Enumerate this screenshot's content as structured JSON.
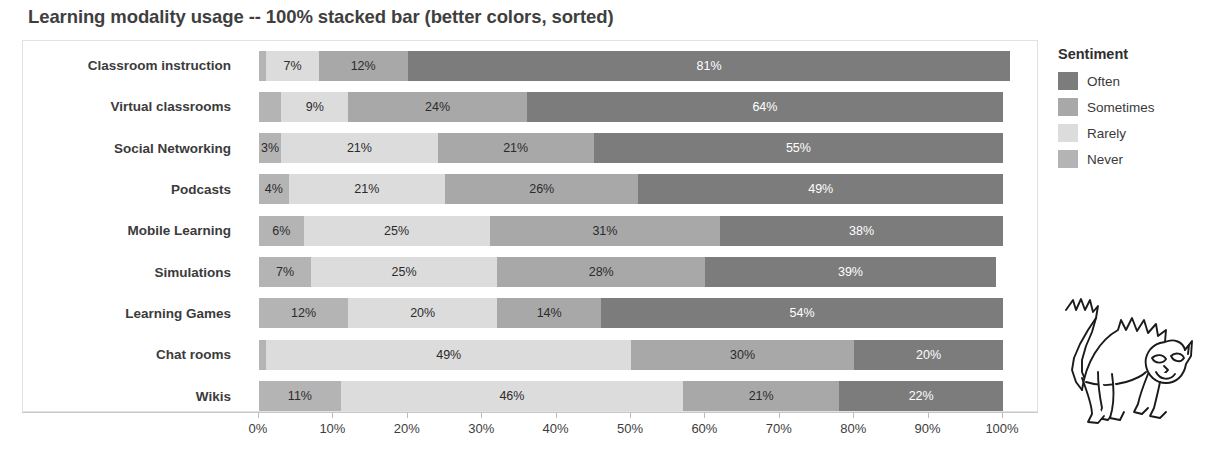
{
  "chart_data": {
    "type": "bar",
    "subtype": "100-percent-stacked-horizontal",
    "title": "Learning modality usage -- 100% stacked bar (better colors, sorted)",
    "xlabel": "",
    "ylabel": "",
    "xlim": [
      0,
      100
    ],
    "grid": false,
    "legend_position": "right",
    "legend_title": "Sentiment",
    "categories": [
      "Classroom instruction",
      "Virtual classrooms",
      "Social Networking",
      "Podcasts",
      "Mobile Learning",
      "Simulations",
      "Learning Games",
      "Chat rooms",
      "Wikis"
    ],
    "xticks": [
      "0%",
      "10%",
      "20%",
      "30%",
      "40%",
      "50%",
      "60%",
      "70%",
      "80%",
      "90%",
      "100%"
    ],
    "xtick_values": [
      0,
      10,
      20,
      30,
      40,
      50,
      60,
      70,
      80,
      90,
      100
    ],
    "series": [
      {
        "name": "Never",
        "color": "#aaaaaa",
        "values": [
          0,
          3,
          0,
          0,
          0,
          0,
          0,
          1,
          0
        ]
      },
      {
        "name": "Rarely",
        "color": "#dcdcdc",
        "values": [
          7,
          9,
          3,
          4,
          6,
          7,
          12,
          49,
          11
        ]
      },
      {
        "name": "Sometimes",
        "color": "#a8a8a8",
        "values": [
          12,
          24,
          21,
          21,
          25,
          25,
          20,
          30,
          46
        ]
      },
      {
        "name": "Often",
        "color": "#7c7c7c",
        "values": [
          81,
          64,
          55,
          49,
          31,
          28,
          14,
          20,
          21
        ]
      }
    ],
    "rows": [
      {
        "category": "Classroom instruction",
        "segments": [
          {
            "sentiment": "Never",
            "value": 1,
            "label": "",
            "label_color": "none"
          },
          {
            "sentiment": "Rarely",
            "value": 7,
            "label": "7%",
            "label_color": "dark"
          },
          {
            "sentiment": "Sometimes",
            "value": 12,
            "label": "12%",
            "label_color": "dark"
          },
          {
            "sentiment": "Often",
            "value": 81,
            "label": "81%",
            "label_color": "light"
          }
        ]
      },
      {
        "category": "Virtual classrooms",
        "segments": [
          {
            "sentiment": "Never",
            "value": 3,
            "label": "",
            "label_color": "none"
          },
          {
            "sentiment": "Rarely",
            "value": 9,
            "label": "9%",
            "label_color": "dark"
          },
          {
            "sentiment": "Sometimes",
            "value": 24,
            "label": "24%",
            "label_color": "dark"
          },
          {
            "sentiment": "Often",
            "value": 64,
            "label": "64%",
            "label_color": "light"
          }
        ]
      },
      {
        "category": "Social Networking",
        "segments": [
          {
            "sentiment": "Never",
            "value": 3,
            "label": "3%",
            "label_color": "dark"
          },
          {
            "sentiment": "Rarely",
            "value": 21,
            "label": "21%",
            "label_color": "dark"
          },
          {
            "sentiment": "Sometimes",
            "value": 21,
            "label": "21%",
            "label_color": "dark"
          },
          {
            "sentiment": "Often",
            "value": 55,
            "label": "55%",
            "label_color": "light"
          }
        ]
      },
      {
        "category": "Podcasts",
        "segments": [
          {
            "sentiment": "Never",
            "value": 4,
            "label": "4%",
            "label_color": "dark"
          },
          {
            "sentiment": "Rarely",
            "value": 21,
            "label": "21%",
            "label_color": "dark"
          },
          {
            "sentiment": "Sometimes",
            "value": 26,
            "label": "26%",
            "label_color": "dark"
          },
          {
            "sentiment": "Often",
            "value": 49,
            "label": "49%",
            "label_color": "light"
          }
        ]
      },
      {
        "category": "Mobile Learning",
        "segments": [
          {
            "sentiment": "Never",
            "value": 6,
            "label": "6%",
            "label_color": "dark"
          },
          {
            "sentiment": "Rarely",
            "value": 25,
            "label": "25%",
            "label_color": "dark"
          },
          {
            "sentiment": "Sometimes",
            "value": 31,
            "label": "31%",
            "label_color": "dark"
          },
          {
            "sentiment": "Often",
            "value": 38,
            "label": "38%",
            "label_color": "light"
          }
        ]
      },
      {
        "category": "Simulations",
        "segments": [
          {
            "sentiment": "Never",
            "value": 7,
            "label": "7%",
            "label_color": "dark"
          },
          {
            "sentiment": "Rarely",
            "value": 25,
            "label": "25%",
            "label_color": "dark"
          },
          {
            "sentiment": "Sometimes",
            "value": 28,
            "label": "28%",
            "label_color": "dark"
          },
          {
            "sentiment": "Often",
            "value": 39,
            "label": "39%",
            "label_color": "light"
          }
        ]
      },
      {
        "category": "Learning Games",
        "segments": [
          {
            "sentiment": "Never",
            "value": 12,
            "label": "12%",
            "label_color": "dark"
          },
          {
            "sentiment": "Rarely",
            "value": 20,
            "label": "20%",
            "label_color": "dark"
          },
          {
            "sentiment": "Sometimes",
            "value": 14,
            "label": "14%",
            "label_color": "dark"
          },
          {
            "sentiment": "Often",
            "value": 54,
            "label": "54%",
            "label_color": "light"
          }
        ]
      },
      {
        "category": "Chat rooms",
        "segments": [
          {
            "sentiment": "Never",
            "value": 1,
            "label": "",
            "label_color": "none"
          },
          {
            "sentiment": "Rarely",
            "value": 49,
            "label": "49%",
            "label_color": "dark"
          },
          {
            "sentiment": "Sometimes",
            "value": 30,
            "label": "30%",
            "label_color": "dark"
          },
          {
            "sentiment": "Often",
            "value": 20,
            "label": "20%",
            "label_color": "light"
          }
        ]
      },
      {
        "category": "Wikis",
        "segments": [
          {
            "sentiment": "Never",
            "value": 11,
            "label": "11%",
            "label_color": "dark"
          },
          {
            "sentiment": "Rarely",
            "value": 46,
            "label": "46%",
            "label_color": "dark"
          },
          {
            "sentiment": "Sometimes",
            "value": 21,
            "label": "21%",
            "label_color": "dark"
          },
          {
            "sentiment": "Often",
            "value": 22,
            "label": "22%",
            "label_color": "light"
          }
        ]
      }
    ]
  },
  "legend": {
    "title": "Sentiment",
    "items": [
      {
        "label": "Often",
        "color": "#7c7c7c"
      },
      {
        "label": "Sometimes",
        "color": "#a8a8a8"
      },
      {
        "label": "Rarely",
        "color": "#dcdcdc"
      },
      {
        "label": "Never",
        "color": "#b4b4b4"
      }
    ]
  },
  "mascot": {
    "name": "cat-line-drawing"
  },
  "colors": {
    "often": "#7c7c7c",
    "sometimes": "#a8a8a8",
    "rarely": "#dcdcdc",
    "never": "#b4b4b4",
    "text": "#3b3b3b",
    "panel_border": "#e2e2e2",
    "axis": "#c8c8c8"
  }
}
